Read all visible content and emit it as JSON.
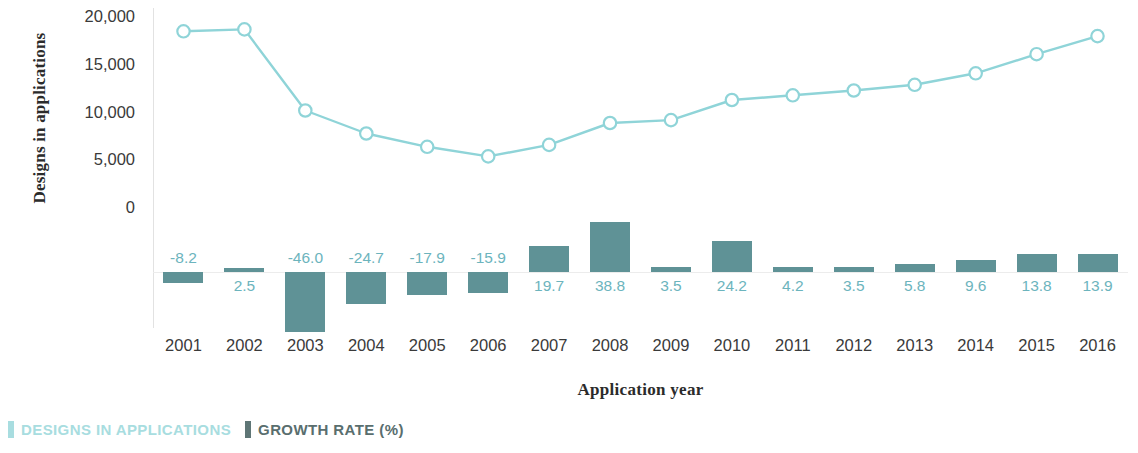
{
  "chart_data": {
    "type": "bar",
    "title": "",
    "subtitle": "",
    "xlabel": "Application year",
    "ylabel": "Designs in applications",
    "categories": [
      "2001",
      "2002",
      "2003",
      "2004",
      "2005",
      "2006",
      "2007",
      "2008",
      "2009",
      "2010",
      "2011",
      "2012",
      "2013",
      "2014",
      "2015",
      "2016"
    ],
    "x_tick_labels": [
      "2001",
      "2002",
      "2003",
      "2004",
      "2005",
      "2006",
      "2007",
      "2008",
      "2009",
      "2010",
      "2011",
      "2012",
      "2013",
      "2014",
      "2015",
      "2016"
    ],
    "y_tick_labels": [
      "20,000",
      "15,000",
      "10,000",
      "5,000",
      "0"
    ],
    "y_tick_values": [
      20000,
      15000,
      10000,
      5000,
      0
    ],
    "ylim": [
      0,
      20000
    ],
    "grid": false,
    "legend_position": "bottom-left",
    "series": [
      {
        "name": "DESIGNS IN APPLICATIONS",
        "type": "line",
        "marker": "open-circle",
        "color": "#8fd4d8",
        "axis": "left",
        "values": [
          18400,
          18600,
          10100,
          7700,
          6300,
          5300,
          6500,
          8800,
          9100,
          11200,
          11700,
          12200,
          12800,
          14000,
          16000,
          17900
        ]
      },
      {
        "name": "GROWTH RATE (%)",
        "type": "bar",
        "color": "#5f9296",
        "axis": "right-hidden",
        "unit": "%",
        "values": [
          -8.2,
          2.5,
          -46.0,
          -24.7,
          -17.9,
          -15.9,
          19.7,
          38.8,
          3.5,
          24.2,
          4.2,
          3.5,
          5.8,
          9.6,
          13.8,
          13.9
        ],
        "data_labels": [
          "-8.2",
          "2.5",
          "-46.0",
          "-24.7",
          "-17.9",
          "-15.9",
          "19.7",
          "38.8",
          "3.5",
          "24.2",
          "4.2",
          "3.5",
          "5.8",
          "9.6",
          "13.8",
          "13.9"
        ]
      }
    ],
    "colors": {
      "line": "#8fd4d8",
      "bar": "#5f9296",
      "data_label": "#6cb4bd",
      "legend_line_text": "#a8dde0",
      "legend_bar_text": "#596e6e",
      "axis_text": "#3a3a3a",
      "axis_title": "#2b2b2b",
      "baseline": "#ececec"
    }
  },
  "axes": {
    "y_title": "Designs in applications",
    "x_title": "Application year"
  },
  "legend": {
    "items": [
      {
        "label": "DESIGNS IN APPLICATIONS",
        "unit": "",
        "swatch": "#a8dde0",
        "text_color": "#a8dde0"
      },
      {
        "label": "GROWTH RATE ",
        "unit": "(%)",
        "swatch": "#5f7676",
        "text_color": "#596e6e"
      }
    ]
  }
}
